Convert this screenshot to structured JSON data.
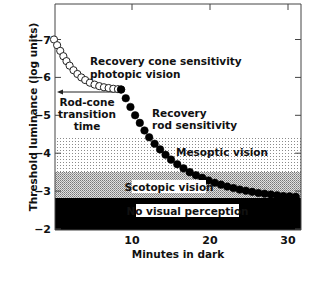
{
  "chart_data": {
    "type": "scatter",
    "title": "",
    "xlabel": "Minutes in dark",
    "ylabel": "Threshold luminance (log units)",
    "xlim": [
      0,
      32
    ],
    "ylim": [
      -2,
      -7.9
    ],
    "x_ticks": [
      10,
      20,
      30
    ],
    "x_tick_labels": [
      "10",
      "20",
      "30"
    ],
    "y_ticks": [
      -7,
      -6,
      -5,
      -4,
      -3,
      -2
    ],
    "y_tick_labels": [
      "−7",
      "−6",
      "−5",
      "−4",
      "−3",
      "−2"
    ],
    "grid": false,
    "legend": null,
    "series": [
      {
        "name": "Recovery cone sensitivity (photopic vision)",
        "marker": "open-circle",
        "x": [
          0.0,
          0.4,
          0.8,
          1.2,
          1.6,
          2.0,
          2.5,
          3.0,
          3.5,
          4.0,
          4.6,
          5.2,
          5.8,
          6.4,
          7.0,
          7.6,
          8.2,
          8.6
        ],
        "y": [
          -7.0,
          -6.85,
          -6.7,
          -6.56,
          -6.43,
          -6.31,
          -6.19,
          -6.09,
          -6.0,
          -5.93,
          -5.86,
          -5.81,
          -5.77,
          -5.74,
          -5.72,
          -5.7,
          -5.69,
          -5.68
        ]
      },
      {
        "name": "Recovery rod sensitivity",
        "marker": "filled-circle",
        "x": [
          8.6,
          9.2,
          9.8,
          10.4,
          11.0,
          11.6,
          12.2,
          12.9,
          13.6,
          14.3,
          15.0,
          15.8,
          16.6,
          17.4,
          18.2,
          19.0,
          19.8,
          20.6,
          21.4,
          22.2,
          23.0,
          23.8,
          24.6,
          25.4,
          26.2,
          27.0,
          27.8,
          28.6,
          29.4,
          30.2,
          31.0
        ],
        "y": [
          -5.68,
          -5.45,
          -5.22,
          -5.0,
          -4.8,
          -4.6,
          -4.42,
          -4.25,
          -4.1,
          -3.96,
          -3.83,
          -3.71,
          -3.6,
          -3.5,
          -3.42,
          -3.35,
          -3.28,
          -3.22,
          -3.17,
          -3.12,
          -3.08,
          -3.04,
          -3.01,
          -2.98,
          -2.95,
          -2.93,
          -2.91,
          -2.89,
          -2.87,
          -2.86,
          -2.85
        ]
      }
    ],
    "regions": [
      {
        "name": "Mesoptic vision",
        "y_from": -4.4,
        "y_to": -3.5,
        "fill": "light-stipple"
      },
      {
        "name": "Scotopic vision",
        "y_from": -3.5,
        "y_to": -2.8,
        "fill": "dense-stipple"
      },
      {
        "name": "No visual perception",
        "y_from": -2.8,
        "y_to": -2.0,
        "fill": "black"
      }
    ],
    "annotations": [
      {
        "text": [
          "Recovery cone sensitivity",
          "photopic vision"
        ]
      },
      {
        "text": [
          "Rod-cone",
          "transition",
          "time"
        ],
        "arrow": "left, from rod-cone break (~9 min) to y-axis at -5.65"
      },
      {
        "text": [
          "Recovery",
          "rod sensitivity"
        ]
      },
      {
        "text": [
          "Mesoptic vision"
        ]
      },
      {
        "text": [
          "Scotopic vision"
        ]
      },
      {
        "text": [
          "No visual perception"
        ]
      }
    ]
  },
  "labels": {
    "xlabel": "Minutes in dark",
    "ylabel": "Threshold luminance (log units)",
    "cone_line1": "Recovery cone sensitivity",
    "cone_line2": "photopic vision",
    "rodcone_line1": "Rod-cone",
    "rodcone_line2": "transition",
    "rodcone_line3": "time",
    "rod_line1": "Recovery",
    "rod_line2": "rod sensitivity",
    "mesoptic": "Mesoptic vision",
    "scotopic": "Scotopic vision",
    "none": "No visual perception"
  }
}
